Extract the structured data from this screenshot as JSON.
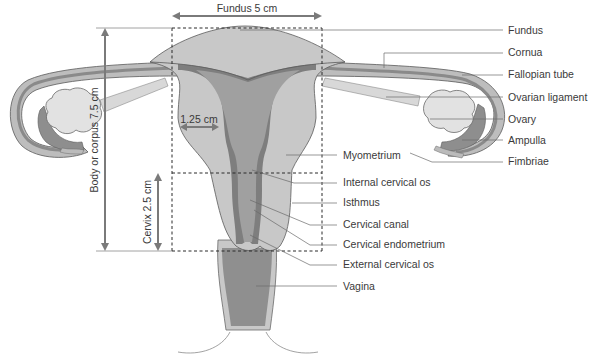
{
  "diagram": {
    "colors": {
      "uterus_body": "#c8c8c8",
      "cavity": "#a0a0a0",
      "endometrium": "#7e7e7e",
      "ovary": "#e2e2e2",
      "ampulla": "#8e8e8e",
      "vagina": "#8f8f8f",
      "outline": "#5a5a5a",
      "label_text": "#3a3a3a"
    },
    "dimensions": {
      "fundus_width": "Fundus 5 cm",
      "body_length": "Body or corpus 7.5 cm",
      "cervix_length": "Cervix 2.5 cm",
      "wall_thickness": "1.25 cm"
    },
    "labels": [
      {
        "id": "fundus",
        "text": "Fundus"
      },
      {
        "id": "cornua",
        "text": "Cornua"
      },
      {
        "id": "fallopian-tube",
        "text": "Fallopian tube"
      },
      {
        "id": "ovarian-ligament",
        "text": "Ovarian ligament"
      },
      {
        "id": "ovary",
        "text": "Ovary"
      },
      {
        "id": "ampulla",
        "text": "Ampulla"
      },
      {
        "id": "fimbriae",
        "text": "Fimbriae"
      },
      {
        "id": "myometrium",
        "text": "Myometrium"
      },
      {
        "id": "internal-cervical-os",
        "text": "Internal cervical os"
      },
      {
        "id": "isthmus",
        "text": "Isthmus"
      },
      {
        "id": "cervical-canal",
        "text": "Cervical canal"
      },
      {
        "id": "cervical-endometrium",
        "text": "Cervical endometrium"
      },
      {
        "id": "external-cervical-os",
        "text": "External cervical os"
      },
      {
        "id": "vagina",
        "text": "Vagina"
      }
    ]
  }
}
